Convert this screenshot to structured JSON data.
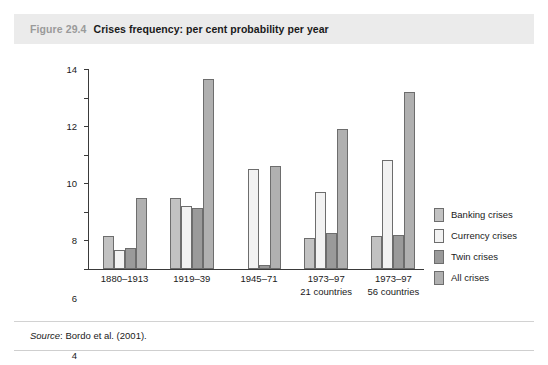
{
  "figure": {
    "number": "Figure 29.4",
    "title": "Crises frequency: per cent probability per year",
    "source_word": "Source",
    "source_rest": ": Bordo et al. (2001)."
  },
  "chart_data": {
    "type": "bar",
    "title": "Crises frequency: per cent probability per year",
    "xlabel": "",
    "ylabel": "",
    "ylim": [
      0,
      14
    ],
    "yticks": [
      0,
      2,
      4,
      6,
      8,
      10,
      12,
      14
    ],
    "grid": false,
    "legend_position": "right",
    "categories": [
      "1880–1913",
      "1919–39",
      "1945–71",
      "1973–97",
      "1973–97"
    ],
    "category_sublabels": [
      "",
      "",
      "",
      "21 countries",
      "56 countries"
    ],
    "series": [
      {
        "name": "Banking crises",
        "color": "#c2c2c2",
        "values": [
          2.3,
          5.0,
          0.0,
          2.2,
          2.3
        ]
      },
      {
        "name": "Currency crises",
        "color": "#f2f2f2",
        "values": [
          1.3,
          4.4,
          7.0,
          5.4,
          7.6
        ]
      },
      {
        "name": "Twin crises",
        "color": "#9a9a9a",
        "values": [
          1.5,
          4.3,
          0.3,
          2.5,
          2.4
        ]
      },
      {
        "name": "All crises",
        "color": "#b0b0b0",
        "values": [
          5.0,
          13.3,
          7.2,
          9.8,
          12.4
        ]
      }
    ]
  }
}
